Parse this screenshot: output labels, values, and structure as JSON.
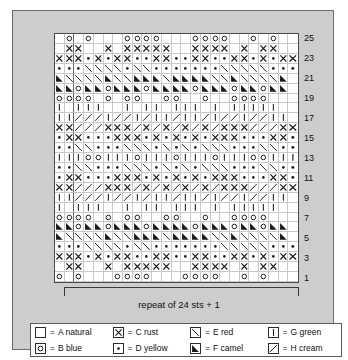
{
  "chart_data": {
    "type": "heatmap",
    "title": "",
    "subtitle": "",
    "xlabel": "",
    "ylabel": "",
    "grid": true,
    "legend_position": "bottom",
    "columns": 25,
    "rows": 25,
    "row_numbers": [
      1,
      3,
      5,
      7,
      9,
      11,
      13,
      15,
      17,
      19,
      21,
      23,
      25
    ],
    "row_number_side": "right",
    "symbol_key": {
      "blank": "A natural",
      "O": "B blue",
      "X": "C rust",
      "D": "D yellow",
      "E": "E red",
      "F": "F camel",
      "G": "G green",
      "H": "H cream"
    },
    "rows_top_to_bottom": [
      ". O . O . . . O O O O . . . O O O O . . O . O . .",
      ". X X . . X . X X X X X . . X X X X . X . X X . .",
      "X X X D X D X X D D X X D D X X D D X X D X D X X X",
      "D D D E E E E D E E D D D D D D D E E E E E D D D",
      "F E E E E F E E F F F E F F F F E E F E E E E F .",
      "F F O F F O F F F O F F F F O F F F O F F O F F .",
      "O O O O . O . O O . . O O . . O . . O O O O . . .",
      "G . G G G . . G . G G . G G G . G . G G G G G . .",
      "G G H H H G H H G H G G H G G H G H H G H H G G .",
      "X X H H H X X X H X H X H X H X H X X X H H H X X",
      "D X X D D D X X X D X D X D X D X X X D D D X X D",
      "D D E E D D D E E E D E D E D E E E D D D E E D D",
      "G G G O O G G G O G G G O G G G O G G G O O G G G",
      "D D E E D D D E E E D E D E D E E E D D D E E D D",
      "D X X D D D X X X D X D X D X D X X X D D D X X D",
      "X X H H H X X X H X H X H X H X H X X X H H H X X",
      "G G H H H G H H G H G G H G G H G H H G H H G G .",
      "G . G G G . . G . G G . G G G . G . G G G G G . .",
      "O O O O . O . O O . . O O . . O . . O O O O . . .",
      "F F O F F O F F F O F F F F O F F F O F F O F F .",
      "F E E E E F E E F F F E F F F F E E F E E E E F .",
      "D D D E E E E D E E D D D D D D D E E E E E D D D",
      "X X X D X D X X D D X X D D X X D D X X D X D X X X",
      ". X X . . X . X X X X X . . X X X X . X . X X . .",
      "O . O . . . O O O O . . . O O O O . . O . O . . ."
    ],
    "major_column_separators": [
      1
    ],
    "major_row_separators": []
  },
  "repeat": {
    "label": "repeat of 24 sts + 1",
    "stitches": 24,
    "plus": 1,
    "bracket_start_column": 2,
    "bracket_end_column": 25
  },
  "legend": {
    "items": [
      {
        "symbol": "blank",
        "eq": "=",
        "label": "A natural"
      },
      {
        "symbol": "X",
        "eq": "=",
        "label": "C rust"
      },
      {
        "symbol": "E",
        "eq": "=",
        "label": "E red"
      },
      {
        "symbol": "G",
        "eq": "=",
        "label": "G green"
      },
      {
        "symbol": "O",
        "eq": "=",
        "label": "B blue"
      },
      {
        "symbol": "D",
        "eq": "=",
        "label": "D yellow"
      },
      {
        "symbol": "F",
        "eq": "=",
        "label": "F camel"
      },
      {
        "symbol": "H",
        "eq": "=",
        "label": "H cream"
      }
    ]
  },
  "colors": {
    "panel_background": "#cdcdcd",
    "chart_background": "#ffffff",
    "grid_line": "#c9c9c9",
    "grid_border": "#4a4a4a",
    "symbol": "#1a1a1a"
  }
}
